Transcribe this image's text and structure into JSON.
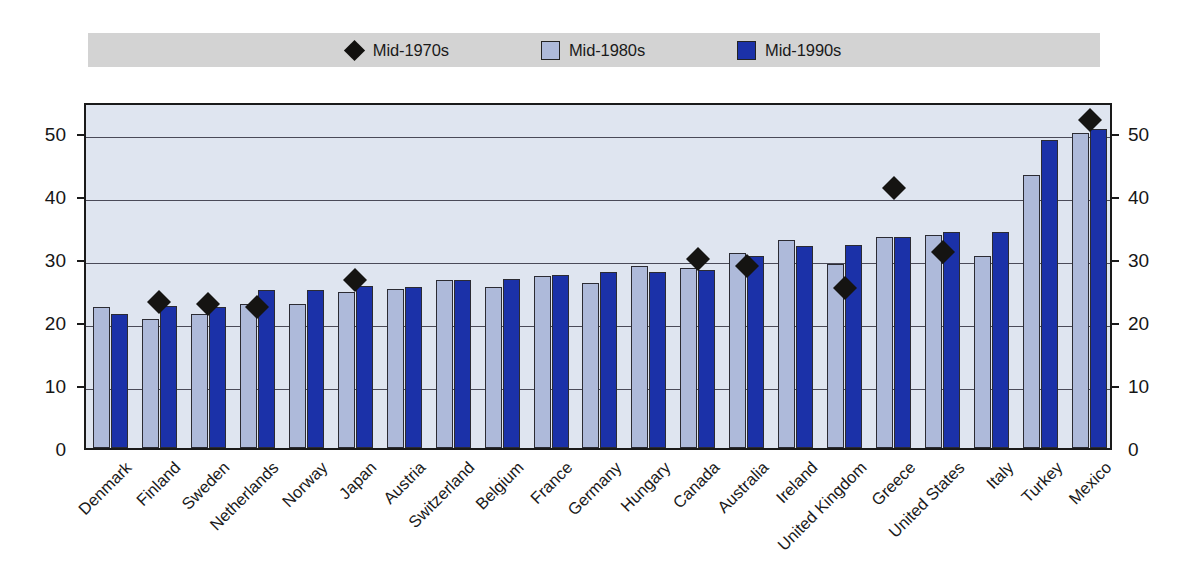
{
  "legend": {
    "items": [
      {
        "label": "Mid-1970s",
        "marker": "diamond-icon",
        "color": "#11100e"
      },
      {
        "label": "Mid-1980s",
        "marker": "square-icon",
        "color": "#aebada"
      },
      {
        "label": "Mid-1990s",
        "marker": "square-icon",
        "color": "#1b31a8"
      }
    ],
    "background": "#d3d3d3"
  },
  "axis": {
    "y_ticks": [
      "0",
      "10",
      "20",
      "30",
      "40",
      "50"
    ],
    "y_ticks_right": [
      "0",
      "10",
      "20",
      "30",
      "40",
      "50"
    ]
  },
  "chart_data": {
    "type": "bar",
    "title": "",
    "subtitle": "",
    "xlabel": "",
    "ylabel": "",
    "ylim": [
      0,
      55
    ],
    "yticks": [
      0,
      10,
      20,
      30,
      40,
      50
    ],
    "grid": true,
    "legend_position": "top",
    "plot_background": "#dfe5f0",
    "categories": [
      "Denmark",
      "Finland",
      "Sweden",
      "Netherlands",
      "Norway",
      "Japan",
      "Austria",
      "Switzerland",
      "Belgium",
      "France",
      "Germany",
      "Hungary",
      "Canada",
      "Australia",
      "Ireland",
      "United Kingdom",
      "Greece",
      "United States",
      "Italy",
      "Turkey",
      "Mexico"
    ],
    "series": [
      {
        "name": "Mid-1980s",
        "type": "bar",
        "color": "#aebada",
        "values": [
          22.3,
          20.4,
          21.2,
          22.9,
          22.8,
          24.8,
          25.2,
          26.6,
          25.5,
          27.2,
          26.2,
          28.9,
          28.6,
          30.9,
          33.0,
          29.1,
          33.4,
          33.7,
          30.4,
          43.2,
          50.0
        ]
      },
      {
        "name": "Mid-1990s",
        "type": "bar",
        "color": "#1b31a8",
        "values": [
          21.2,
          22.5,
          22.3,
          25.0,
          25.1,
          25.7,
          25.5,
          26.6,
          26.8,
          27.4,
          27.9,
          27.9,
          28.2,
          30.4,
          32.0,
          32.2,
          33.4,
          34.2,
          34.3,
          48.8,
          50.5
        ]
      },
      {
        "name": "Mid-1970s",
        "type": "scatter",
        "color": "#151412",
        "marker": "diamond",
        "values": [
          null,
          23.2,
          22.9,
          22.3,
          null,
          26.7,
          null,
          null,
          null,
          null,
          null,
          null,
          29.9,
          28.9,
          null,
          25.3,
          41.2,
          31.0,
          null,
          null,
          52.0
        ]
      }
    ]
  }
}
